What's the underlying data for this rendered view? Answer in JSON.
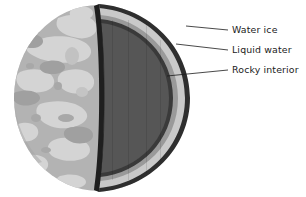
{
  "figure": {
    "background_color": "#ffffff",
    "type": "cutaway-cross-section-diagram"
  },
  "sphere": {
    "surface_name": "icy-cratered-surface",
    "surface_base_color": "#b2b2b2",
    "surface_patch_color": "#d2d2d2",
    "surface_shadow_color": "#9d9d9d",
    "outline_color": "#2b2b2b"
  },
  "layers": [
    {
      "id": "water-ice",
      "label": "Water ice",
      "color": "#c9c9c9",
      "order": 1
    },
    {
      "id": "liquid-water",
      "label": "Liquid water",
      "color": "#9a9a9a",
      "order": 2
    },
    {
      "id": "rocky-interior",
      "label": "Rocky interior",
      "color": "#555555",
      "order": 3
    }
  ],
  "callouts": [
    {
      "id": "water-ice",
      "label": "Water ice",
      "text_x": 232,
      "text_y": 30,
      "leader_from_x": 186,
      "leader_from_y": 26,
      "leader_to_x": 228,
      "leader_to_y": 30
    },
    {
      "id": "liquid-water",
      "label": "Liquid water",
      "text_x": 232,
      "text_y": 50,
      "leader_from_x": 176,
      "leader_from_y": 44,
      "leader_to_x": 228,
      "leader_to_y": 50
    },
    {
      "id": "rocky-interior",
      "label": "Rocky interior",
      "text_x": 232,
      "text_y": 70,
      "leader_from_x": 167,
      "leader_from_y": 76,
      "leader_to_x": 228,
      "leader_to_y": 70
    }
  ],
  "leader_line_color": "#1b1b1b"
}
